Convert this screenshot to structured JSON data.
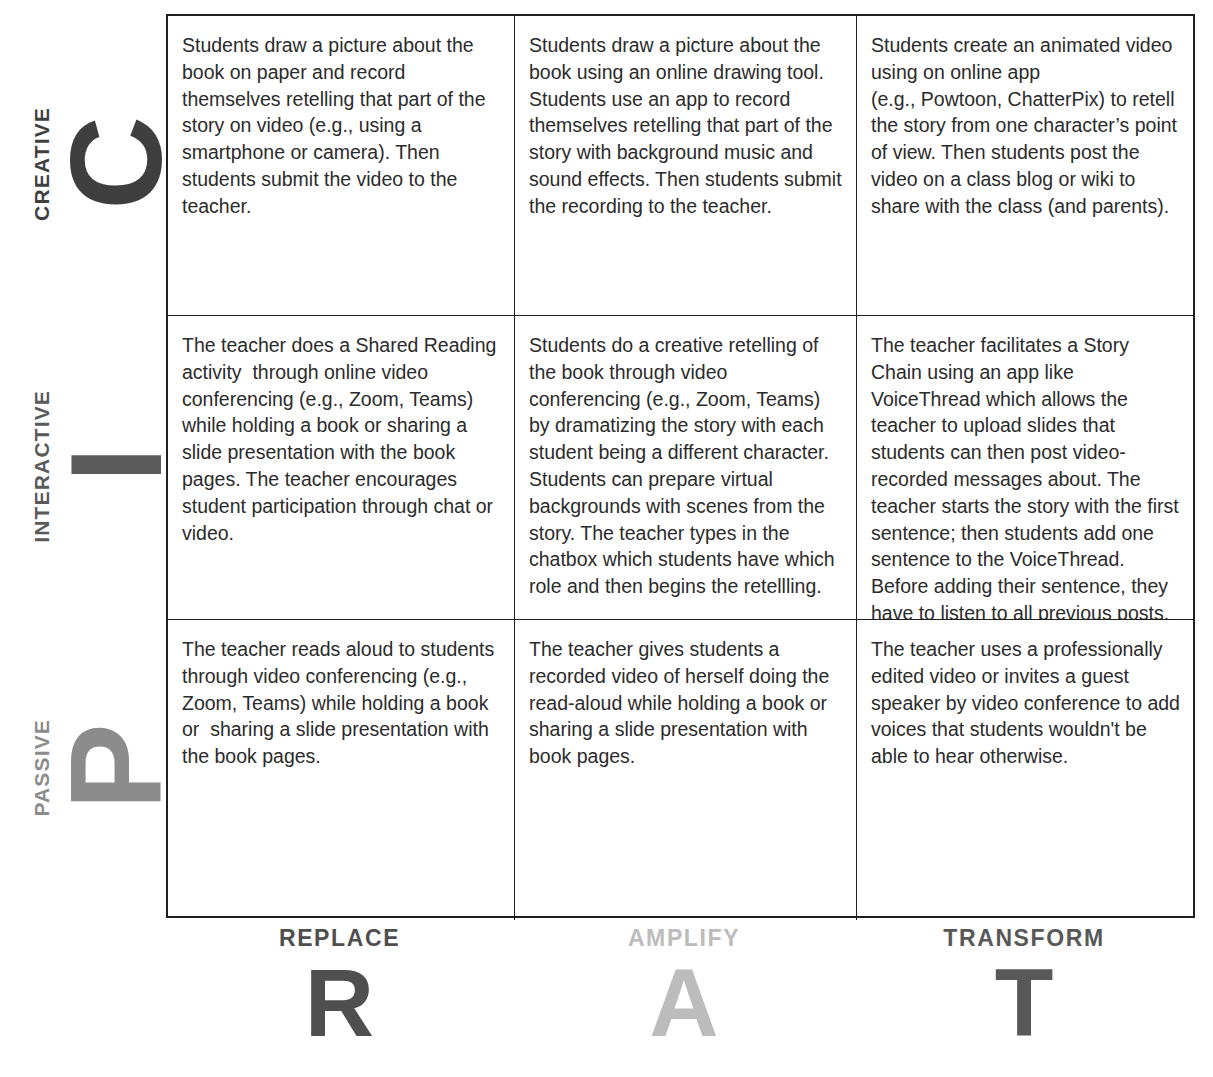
{
  "matrix": {
    "title": "RAT / PIC technology integration matrix",
    "row_axis": [
      {
        "letter": "C",
        "word": "CREATIVE",
        "color": "#3f3f3f",
        "letter_size": "130px"
      },
      {
        "letter": "I",
        "word": "INTERACTIVE",
        "color": "#5a5a5a",
        "letter_size": "130px"
      },
      {
        "letter": "P",
        "word": "PASSIVE",
        "color": "#8c8c8c",
        "letter_size": "130px"
      }
    ],
    "col_axis": [
      {
        "word": "REPLACE",
        "letter": "R",
        "color": "#4f4f4f"
      },
      {
        "word": "AMPLIFY",
        "letter": "A",
        "color": "#bcbcbc"
      },
      {
        "word": "TRANSFORM",
        "letter": "T",
        "color": "#585858"
      }
    ],
    "cells": [
      [
        "Students draw a picture about the book on paper and record themselves retelling that part of the story on video (e.g., using a smartphone or camera). Then students submit the video to the teacher.",
        "Students draw a picture about the book using an online drawing tool. Students use an app to record themselves retelling that part of the story with background music and sound effects. Then students submit the recording to the teacher.",
        "Students create an animated video using on online app\n(e.g., Powtoon, ChatterPix) to retell the story from one character’s point of view. Then students post the video on a class blog or wiki to share with the class (and parents)."
      ],
      [
        "The teacher does a Shared Reading activity  through online video conferencing (e.g., Zoom, Teams) while holding a book or sharing a slide presentation with the book pages. The teacher encourages student participation through chat or video.",
        "Students do a creative retelling of the book through video conferencing (e.g., Zoom, Teams) by dramatizing the story with each student being a different character. Students can prepare virtual backgrounds with scenes from the story. The teacher types in the chatbox which students have which role and then begins the retellling.",
        "The teacher facilitates a Story Chain using an app like VoiceThread which allows the teacher to upload slides that students can then post video-recorded messages about. The teacher starts the story with the first sentence; then students add one sentence to the VoiceThread. Before adding their sentence, they have to listen to all previous posts."
      ],
      [
        "The teacher reads aloud to students through video conferencing (e.g., Zoom, Teams) while holding a book or  sharing a slide presentation with the book pages.",
        "The teacher gives students a recorded video of herself doing the read-aloud while holding a book or sharing a slide presentation with book pages.",
        "The teacher uses a professionally edited video or invites a guest speaker by video conference to add voices that students wouldn't be able to hear otherwise."
      ]
    ]
  }
}
